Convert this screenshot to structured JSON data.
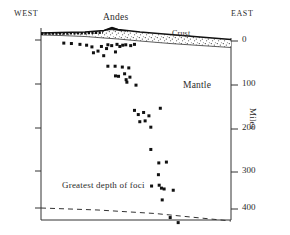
{
  "figure": {
    "title": "",
    "direction_left": "WEST",
    "direction_right": "EAST",
    "annotations": {
      "andes": "Andes",
      "crust": "Crust",
      "mantle": "Mantle",
      "greatest_depth": "Greatest depth of foci"
    },
    "axis": {
      "y_label": "Miles",
      "y_ticks": [
        "0",
        "100",
        "200",
        "300",
        "400"
      ]
    },
    "colors": {
      "ink": "#222222",
      "frame": "#333333",
      "point": "#111111",
      "stipple": "#444444"
    }
  },
  "chart_data": {
    "type": "scatter",
    "xlabel": "",
    "ylabel": "Miles",
    "ylim": [
      0,
      460
    ],
    "y_inverted": true,
    "grid": false,
    "legend": null,
    "y_ticks": [
      0,
      100,
      200,
      300,
      400
    ],
    "x_ticks": [],
    "x_direction_labels": {
      "left": "WEST",
      "right": "EAST"
    },
    "annotations": [
      {
        "text": "Andes",
        "x": 0.32,
        "y": -25
      },
      {
        "text": "Crust",
        "x": 0.7,
        "y": 12
      },
      {
        "text": "Mantle",
        "x": 0.75,
        "y": 100
      },
      {
        "text": "Greatest depth of foci",
        "x": 0.22,
        "y": 375
      },
      {
        "text": "WEST",
        "x": 0.02,
        "y": -48
      },
      {
        "text": "EAST",
        "x": 0.96,
        "y": -48
      }
    ],
    "series": [
      {
        "name": "Earthquake foci",
        "marker": "square",
        "points": [
          [
            0.12,
            5
          ],
          [
            0.16,
            6
          ],
          [
            0.205,
            8
          ],
          [
            0.24,
            10
          ],
          [
            0.268,
            14
          ],
          [
            0.276,
            28
          ],
          [
            0.3,
            24
          ],
          [
            0.318,
            13
          ],
          [
            0.33,
            35
          ],
          [
            0.345,
            18
          ],
          [
            0.352,
            9
          ],
          [
            0.372,
            11
          ],
          [
            0.392,
            26
          ],
          [
            0.4,
            8
          ],
          [
            0.415,
            13
          ],
          [
            0.43,
            10
          ],
          [
            0.446,
            9
          ],
          [
            0.472,
            11
          ],
          [
            0.492,
            8
          ],
          [
            0.352,
            60
          ],
          [
            0.39,
            60
          ],
          [
            0.428,
            62
          ],
          [
            0.462,
            64
          ],
          [
            0.392,
            83
          ],
          [
            0.408,
            84
          ],
          [
            0.44,
            78
          ],
          [
            0.448,
            92
          ],
          [
            0.452,
            98
          ],
          [
            0.468,
            86
          ],
          [
            0.5,
            105
          ],
          [
            0.492,
            165
          ],
          [
            0.512,
            175
          ],
          [
            0.52,
            192
          ],
          [
            0.54,
            170
          ],
          [
            0.548,
            190
          ],
          [
            0.568,
            178
          ],
          [
            0.578,
            205
          ],
          [
            0.628,
            160
          ],
          [
            0.578,
            258
          ],
          [
            0.62,
            290
          ],
          [
            0.618,
            318
          ],
          [
            0.66,
            288
          ],
          [
            0.582,
            345
          ],
          [
            0.622,
            343
          ],
          [
            0.634,
            350
          ],
          [
            0.648,
            352
          ],
          [
            0.638,
            378
          ],
          [
            0.696,
            355
          ],
          [
            0.68,
            420
          ],
          [
            0.722,
            432
          ]
        ]
      }
    ],
    "reference_lines": [
      {
        "name": "Greatest depth of foci",
        "style": "dashed",
        "points": [
          [
            0.0,
            385
          ],
          [
            0.3,
            390
          ],
          [
            0.6,
            405
          ],
          [
            1.0,
            437
          ]
        ]
      }
    ],
    "bands": [
      {
        "name": "Crust",
        "fill": "stipple",
        "description": "Stippled crustal wedge thickening eastward beneath the Andes"
      },
      {
        "name": "Mantle",
        "fill": "none",
        "description": "Unshaded region below the crust containing the earthquake foci"
      }
    ]
  }
}
